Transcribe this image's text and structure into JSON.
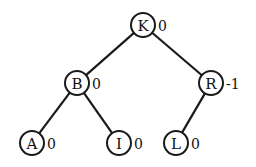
{
  "diagram": {
    "type": "binary-tree",
    "nodes": [
      {
        "id": "K",
        "label": "K",
        "balance": "0",
        "x": 143,
        "y": 25
      },
      {
        "id": "B",
        "label": "B",
        "balance": "0",
        "x": 77,
        "y": 83
      },
      {
        "id": "R",
        "label": "R",
        "balance": "-1",
        "x": 211,
        "y": 83
      },
      {
        "id": "A",
        "label": "A",
        "balance": "0",
        "x": 32,
        "y": 143
      },
      {
        "id": "I",
        "label": "I",
        "balance": "0",
        "x": 119,
        "y": 143
      },
      {
        "id": "L",
        "label": "L",
        "balance": "0",
        "x": 176,
        "y": 143
      }
    ],
    "edges": [
      {
        "from": "K",
        "to": "B"
      },
      {
        "from": "K",
        "to": "R"
      },
      {
        "from": "B",
        "to": "A"
      },
      {
        "from": "B",
        "to": "I"
      },
      {
        "from": "R",
        "to": "L"
      }
    ],
    "node_radius": 12,
    "stroke_color": "#1a1a1a",
    "fill_color": "#ffffff"
  }
}
